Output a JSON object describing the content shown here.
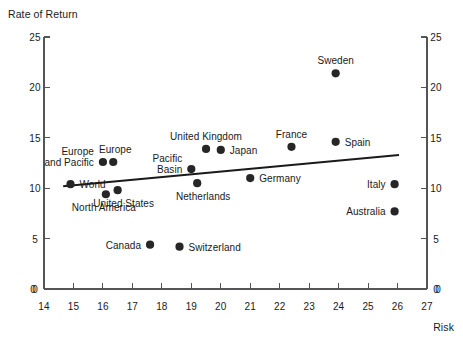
{
  "chart_data": {
    "type": "scatter",
    "title": "",
    "ylabel": "Rate of Return",
    "xlabel": "Risk",
    "xlim": [
      14,
      27
    ],
    "ylim": [
      0,
      25
    ],
    "xticks": [
      14,
      15,
      16,
      17,
      18,
      19,
      20,
      21,
      22,
      23,
      24,
      25,
      26,
      27
    ],
    "yticks": [
      0,
      5,
      10,
      15,
      20,
      25
    ],
    "x_axis_zero_label_left": "0",
    "x_axis_zero_label_right": "0",
    "grid": false,
    "legend": "none",
    "points": [
      {
        "label": "World",
        "x": 14.9,
        "y": 10.4,
        "label_pos": "right"
      },
      {
        "label": "Europe\nand Pacific",
        "x": 16.0,
        "y": 12.6,
        "label_pos": "left-multiline"
      },
      {
        "label": "Europe",
        "x": 16.35,
        "y": 12.6,
        "label_pos": "above-right"
      },
      {
        "label": "North America",
        "x": 16.1,
        "y": 9.4,
        "label_pos": "below-left"
      },
      {
        "label": "United States",
        "x": 16.5,
        "y": 9.8,
        "label_pos": "below-right"
      },
      {
        "label": "Canada",
        "x": 17.6,
        "y": 4.4,
        "label_pos": "left"
      },
      {
        "label": "Switzerland",
        "x": 18.6,
        "y": 4.2,
        "label_pos": "right"
      },
      {
        "label": "Pacific\nBasin",
        "x": 19.0,
        "y": 11.9,
        "label_pos": "left-multiline"
      },
      {
        "label": "Netherlands",
        "x": 19.2,
        "y": 10.5,
        "label_pos": "below-right"
      },
      {
        "label": "United Kingdom",
        "x": 19.5,
        "y": 13.9,
        "label_pos": "above"
      },
      {
        "label": "Japan",
        "x": 20.0,
        "y": 13.8,
        "label_pos": "right"
      },
      {
        "label": "Germany",
        "x": 21.0,
        "y": 11.0,
        "label_pos": "right"
      },
      {
        "label": "France",
        "x": 22.4,
        "y": 14.1,
        "label_pos": "above"
      },
      {
        "label": "Spain",
        "x": 23.9,
        "y": 14.6,
        "label_pos": "right"
      },
      {
        "label": "Sweden",
        "x": 23.9,
        "y": 21.4,
        "label_pos": "above"
      },
      {
        "label": "Italy",
        "x": 25.9,
        "y": 10.4,
        "label_pos": "left"
      },
      {
        "label": "Australia",
        "x": 25.9,
        "y": 7.7,
        "label_pos": "left"
      }
    ],
    "trendline": {
      "x_start": 14.65,
      "y_start": 10.2,
      "x_end": 26.05,
      "y_end": 13.3
    },
    "colors": {
      "marker": "#262626",
      "axis": "#555555",
      "trendline": "#1a1a1a",
      "text": "#1a1a1a",
      "background": "#ffffff"
    }
  }
}
